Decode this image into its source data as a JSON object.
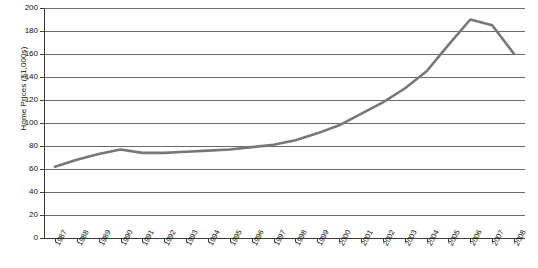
{
  "chart_data": {
    "type": "line",
    "title": "",
    "xlabel": "",
    "ylabel": "Home Prices ($1,000s)",
    "ylim": [
      0,
      200
    ],
    "ytick_step": 20,
    "yticks": [
      0,
      20,
      40,
      60,
      80,
      100,
      120,
      140,
      160,
      180,
      200
    ],
    "grid": true,
    "legend": "none",
    "line_color": "#777777",
    "categories": [
      "1987",
      "1988",
      "1989",
      "1990",
      "1991",
      "1992",
      "1993",
      "1994",
      "1995",
      "1996",
      "1997",
      "1998",
      "1999",
      "2000",
      "2001",
      "2002",
      "2003",
      "2004",
      "2005",
      "2006",
      "2007",
      "2008"
    ],
    "series": [
      {
        "name": "Home Prices",
        "values": [
          62,
          68,
          73,
          77,
          74,
          74,
          75,
          76,
          77,
          79,
          81,
          85,
          91,
          98,
          108,
          118,
          130,
          145,
          168,
          190,
          185,
          160
        ]
      }
    ]
  }
}
